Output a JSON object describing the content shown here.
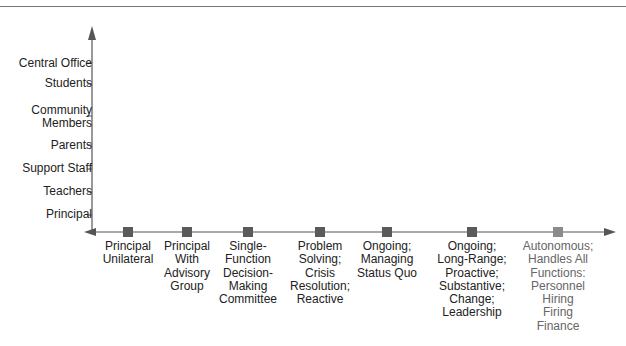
{
  "diagram": {
    "type": "two-axis continuum",
    "y_axis": {
      "labels": [
        "Central Office",
        "Students",
        "Community Members",
        "Parents",
        "Support Staff",
        "Teachers",
        "Principal"
      ],
      "label_lines": [
        [
          "Central Office"
        ],
        [
          "Students"
        ],
        [
          "Community",
          "Members"
        ],
        [
          "Parents"
        ],
        [
          "Support Staff"
        ],
        [
          "Teachers"
        ],
        [
          "Principal"
        ]
      ]
    },
    "x_axis": {
      "points": [
        {
          "lines": [
            "Principal",
            "Unilateral"
          ]
        },
        {
          "lines": [
            "Principal",
            "With",
            "Advisory",
            "Group"
          ]
        },
        {
          "lines": [
            "Single-",
            "Function",
            "Decision-",
            "Making",
            "Committee"
          ]
        },
        {
          "lines": [
            "Problem",
            "Solving;",
            "Crisis",
            "Resolution;",
            "Reactive"
          ]
        },
        {
          "lines": [
            "Ongoing;",
            "Managing",
            "Status Quo"
          ]
        },
        {
          "lines": [
            "Ongoing;",
            "Long-Range;",
            "Proactive;",
            "Substantive;",
            "Change;",
            "Leadership"
          ]
        },
        {
          "lines": [
            "Autonomous;",
            "Handles All",
            "Functions:",
            "Personnel",
            "Hiring",
            "Firing",
            "Finance"
          ]
        }
      ]
    },
    "colors": {
      "axis": "#555555",
      "marker": "#5a5a5a",
      "marker_last": "#8a8a8a",
      "text": "#222222"
    }
  }
}
